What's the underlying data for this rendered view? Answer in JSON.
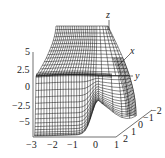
{
  "chart_data": {
    "type": "surface3d",
    "title": "",
    "axes": {
      "x_label": "x",
      "y_label": "y",
      "z_label": "z"
    },
    "x_ticks": [
      "-3",
      "-2",
      "-1",
      "0",
      "1"
    ],
    "y_ticks": [
      "2",
      "1",
      "0",
      "-1",
      "-2"
    ],
    "z_ticks": [
      "5",
      "2.5",
      "0",
      "-2.5",
      "-5"
    ],
    "x_range": [
      -3,
      1
    ],
    "y_range": [
      -2,
      2
    ],
    "z_range": [
      -5,
      5
    ],
    "style": "black wireframe mesh on white"
  },
  "labels": {
    "z": "z",
    "x": "x",
    "y": "y",
    "zt": [
      "5",
      "2.5",
      "0",
      "−2.5",
      "−5"
    ],
    "xt": [
      "−3",
      "−2",
      "−1",
      "0",
      "1"
    ],
    "yt": [
      "2",
      "1",
      "0",
      "−1",
      "−2"
    ]
  }
}
